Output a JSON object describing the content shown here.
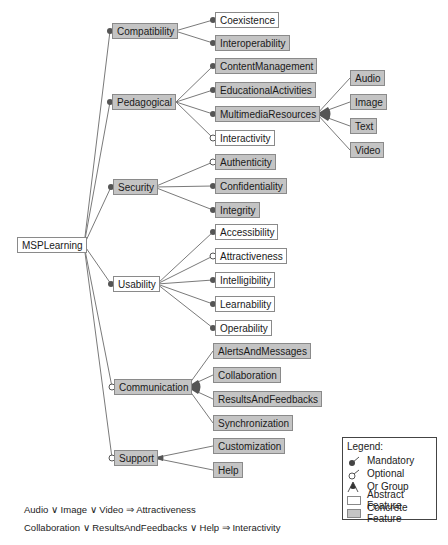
{
  "diagram": {
    "type": "feature-model",
    "root": {
      "label": "MSPLearning",
      "kind": "abstract"
    },
    "features": [
      {
        "label": "Compatibility",
        "kind": "concrete",
        "relation": "mandatory",
        "group": "and",
        "children": [
          {
            "label": "Coexistence",
            "kind": "abstract",
            "relation": "mandatory"
          },
          {
            "label": "Interoperability",
            "kind": "concrete",
            "relation": "mandatory"
          }
        ]
      },
      {
        "label": "Pedagogical",
        "kind": "concrete",
        "relation": "mandatory",
        "group": "and",
        "children": [
          {
            "label": "ContentManagement",
            "kind": "concrete",
            "relation": "mandatory"
          },
          {
            "label": "EducationalActivities",
            "kind": "concrete",
            "relation": "mandatory"
          },
          {
            "label": "MultimediaResources",
            "kind": "concrete",
            "relation": "mandatory",
            "group": "or",
            "children": [
              {
                "label": "Audio",
                "kind": "concrete"
              },
              {
                "label": "Image",
                "kind": "concrete"
              },
              {
                "label": "Text",
                "kind": "concrete"
              },
              {
                "label": "Video",
                "kind": "concrete"
              }
            ]
          },
          {
            "label": "Interactivity",
            "kind": "abstract",
            "relation": "optional"
          }
        ]
      },
      {
        "label": "Security",
        "kind": "concrete",
        "relation": "mandatory",
        "group": "and",
        "children": [
          {
            "label": "Authenticity",
            "kind": "concrete",
            "relation": "optional"
          },
          {
            "label": "Confidentiality",
            "kind": "concrete",
            "relation": "mandatory"
          },
          {
            "label": "Integrity",
            "kind": "concrete",
            "relation": "mandatory"
          }
        ]
      },
      {
        "label": "Usability",
        "kind": "abstract",
        "relation": "mandatory",
        "group": "and",
        "children": [
          {
            "label": "Accessibility",
            "kind": "abstract",
            "relation": "mandatory"
          },
          {
            "label": "Attractiveness",
            "kind": "abstract",
            "relation": "optional"
          },
          {
            "label": "Intelligibility",
            "kind": "abstract",
            "relation": "mandatory"
          },
          {
            "label": "Learnability",
            "kind": "abstract",
            "relation": "mandatory"
          },
          {
            "label": "Operability",
            "kind": "abstract",
            "relation": "mandatory"
          }
        ]
      },
      {
        "label": "Communication",
        "kind": "concrete",
        "relation": "optional",
        "group": "or",
        "children": [
          {
            "label": "AlertsAndMessages",
            "kind": "concrete"
          },
          {
            "label": "Collaboration",
            "kind": "concrete"
          },
          {
            "label": "ResultsAndFeedbacks",
            "kind": "concrete"
          },
          {
            "label": "Synchronization",
            "kind": "concrete"
          }
        ]
      },
      {
        "label": "Support",
        "kind": "concrete",
        "relation": "optional",
        "group": "alternative",
        "children": [
          {
            "label": "Customization",
            "kind": "concrete"
          },
          {
            "label": "Help",
            "kind": "concrete"
          }
        ]
      }
    ],
    "constraints": [
      "Audio ∨ Image ∨ Video ⇒ Attractiveness",
      "Collaboration ∨ ResultsAndFeedbacks ∨ Help ⇒ Interactivity"
    ]
  },
  "legend": {
    "title": "Legend:",
    "items": [
      {
        "label": "Mandatory",
        "icon": "filled-circle-icon"
      },
      {
        "label": "Optional",
        "icon": "hollow-circle-icon"
      },
      {
        "label": "Or Group",
        "icon": "filled-arc-icon"
      },
      {
        "label": "Abstract Feature",
        "icon": "white-box-icon"
      },
      {
        "label": "Concrete Feature",
        "icon": "gray-box-icon"
      }
    ]
  },
  "colors": {
    "concrete_fill": "#c4c4c4",
    "abstract_fill": "#ffffff",
    "edge": "#7a7a7a",
    "border": "#8a8a8a",
    "dot": "#555555"
  }
}
